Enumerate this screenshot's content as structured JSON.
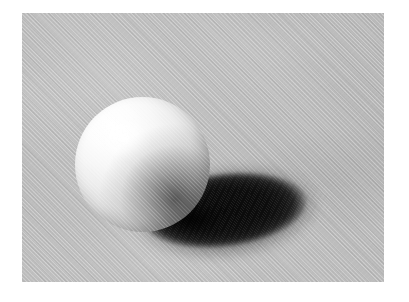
{
  "image": {
    "kind": "rendered-illustration",
    "subject": "matte sphere resting on a flat plane with a hard cast shadow",
    "medium_texture": "fine diagonal canvas weave grain over the whole plate",
    "color_mode": "grayscale",
    "canvas": {
      "width_px": 409,
      "height_px": 302,
      "margin_color": "#ffffff"
    },
    "plate": {
      "left_px": 22,
      "top_px": 13,
      "width_px": 362,
      "height_px": 269,
      "background_color": "#bdbdbd",
      "background_color_light": "#c9c9c9",
      "background_color_dark": "#b2b2b2"
    },
    "light": {
      "direction": "upper-left",
      "key_color": "#ffffff",
      "terminator_color": "#6f6f6f"
    },
    "sphere": {
      "center_x_px": 142,
      "center_y_px": 164,
      "diameter_px": 135,
      "highlight_color": "#ffffff",
      "midtone_color": "#dedede",
      "shade_color": "#8d8d8d",
      "terminator_color": "#707070"
    },
    "cast_shadow": {
      "shape": "ellipse",
      "center_x_px": 245,
      "center_y_px": 212,
      "width_px": 192,
      "height_px": 82,
      "rotation_deg": -7,
      "core_color": "#0a0a0a",
      "penumbra_color": "#1a1a1a"
    }
  }
}
